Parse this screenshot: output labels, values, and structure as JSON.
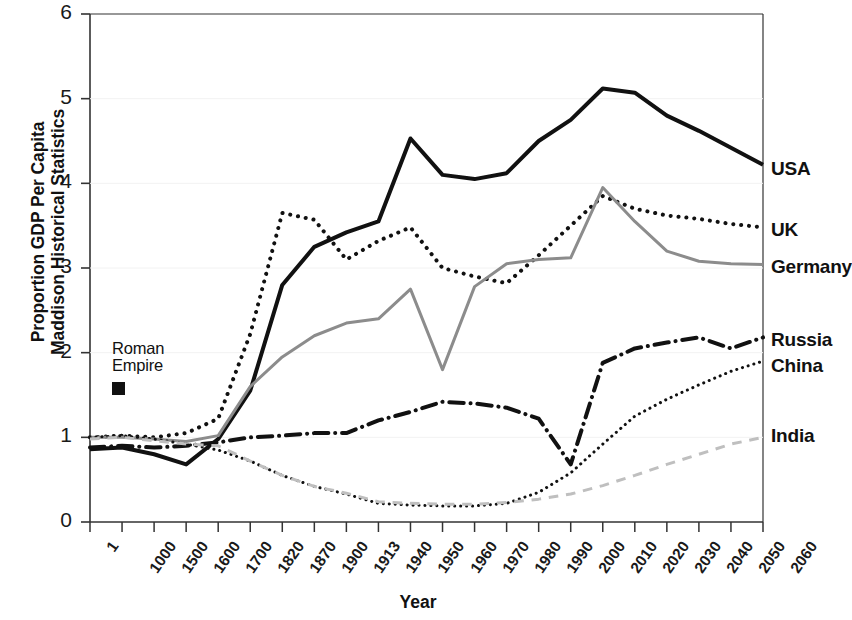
{
  "chart_data": {
    "type": "line",
    "title": "",
    "xlabel": "Year",
    "ylabel": "Proportion GDP Per Capita\nMaddison Historical Statistics",
    "ylim": [
      0,
      6
    ],
    "yticks": [
      0,
      1,
      2,
      3,
      4,
      5,
      6
    ],
    "grid": false,
    "legend_position": "right-inline",
    "x": [
      "1",
      "1000",
      "1500",
      "1600",
      "1700",
      "1820",
      "1870",
      "1900",
      "1913",
      "1940",
      "1950",
      "1960",
      "1970",
      "1980",
      "1990",
      "2000",
      "2010",
      "2020",
      "2030",
      "2040",
      "2050",
      "2060"
    ],
    "categories": [
      "1",
      "1000",
      "1500",
      "1600",
      "1700",
      "1820",
      "1870",
      "1900",
      "1913",
      "1940",
      "1950",
      "1960",
      "1970",
      "1980",
      "1990",
      "2000",
      "2010",
      "2020",
      "2030",
      "2040",
      "2050",
      "2060"
    ],
    "annotations": [
      {
        "text": "Roman\nEmpire",
        "x_index": 1,
        "y": 2.0,
        "marker": "square"
      }
    ],
    "series": [
      {
        "name": "USA",
        "style": "solid",
        "color": "#111111",
        "width": 4,
        "values": [
          0.86,
          0.88,
          0.8,
          0.68,
          0.98,
          1.55,
          2.8,
          3.25,
          3.42,
          3.55,
          4.53,
          4.1,
          4.05,
          4.12,
          4.5,
          4.75,
          5.12,
          5.07,
          4.8,
          4.62,
          4.42,
          4.22
        ]
      },
      {
        "name": "UK",
        "style": "dotted",
        "color": "#111111",
        "width": 4,
        "values": [
          1.0,
          1.02,
          1.0,
          1.05,
          1.22,
          2.22,
          3.65,
          3.57,
          3.1,
          3.32,
          3.48,
          3.0,
          2.9,
          2.82,
          3.15,
          3.5,
          3.85,
          3.7,
          3.62,
          3.58,
          3.52,
          3.48
        ]
      },
      {
        "name": "Germany",
        "style": "solid",
        "color": "#8c8c8c",
        "width": 3,
        "values": [
          1.0,
          1.0,
          0.98,
          0.95,
          1.02,
          1.6,
          1.95,
          2.2,
          2.35,
          2.4,
          2.75,
          1.8,
          2.78,
          3.05,
          3.1,
          3.12,
          3.95,
          3.55,
          3.2,
          3.08,
          3.05,
          3.04
        ]
      },
      {
        "name": "Russia",
        "style": "dashdot",
        "color": "#111111",
        "width": 4,
        "values": [
          0.88,
          0.9,
          0.88,
          0.9,
          0.94,
          1.0,
          1.02,
          1.05,
          1.05,
          1.2,
          1.3,
          1.42,
          1.4,
          1.35,
          1.22,
          0.68,
          1.88,
          2.05,
          2.12,
          2.18,
          2.05,
          2.18
        ]
      },
      {
        "name": "China",
        "style": "dotted",
        "color": "#111111",
        "width": 3,
        "values": [
          1.0,
          1.02,
          0.98,
          0.92,
          0.85,
          0.72,
          0.55,
          0.42,
          0.33,
          0.22,
          0.2,
          0.19,
          0.19,
          0.22,
          0.35,
          0.58,
          0.92,
          1.25,
          1.45,
          1.62,
          1.78,
          1.9
        ]
      },
      {
        "name": "India",
        "style": "dashed",
        "color": "#bfbfbf",
        "width": 3,
        "values": [
          0.98,
          1.0,
          0.96,
          0.92,
          0.9,
          0.72,
          0.55,
          0.42,
          0.34,
          0.24,
          0.22,
          0.21,
          0.21,
          0.23,
          0.27,
          0.33,
          0.43,
          0.55,
          0.68,
          0.8,
          0.92,
          1.0
        ]
      }
    ],
    "series_label_positions": [
      {
        "name": "USA",
        "top": 158
      },
      {
        "name": "UK",
        "top": 219
      },
      {
        "name": "Germany",
        "top": 256
      },
      {
        "name": "Russia",
        "top": 329
      },
      {
        "name": "China",
        "top": 355
      },
      {
        "name": "India",
        "top": 425
      }
    ]
  }
}
